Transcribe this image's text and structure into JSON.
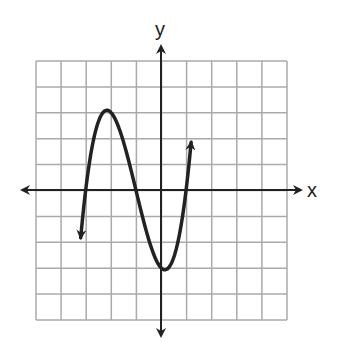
{
  "chart_data": {
    "type": "line",
    "title": "",
    "xlabel": "x",
    "ylabel": "y",
    "grid": true,
    "xlim": [
      -5,
      5
    ],
    "ylim": [
      -5,
      5
    ],
    "grid_step": 1,
    "tick_labels_shown": false,
    "function": "y = (x + 3)(x + 1)(x - 1)",
    "roots": [
      -3,
      -1,
      1
    ],
    "local_max": {
      "x": -2.15,
      "y": 3.08
    },
    "local_min": {
      "x": 0.15,
      "y": -3.08
    },
    "domain_drawn": [
      -3.2,
      1.2
    ],
    "end_behavior": {
      "left": "arrow down",
      "right": "arrow up"
    },
    "series": [
      {
        "name": "cubic",
        "x": [
          -3.2,
          -3.0,
          -2.8,
          -2.6,
          -2.4,
          -2.2,
          -2.0,
          -1.8,
          -1.6,
          -1.4,
          -1.2,
          -1.0,
          -0.8,
          -0.6,
          -0.4,
          -0.2,
          0.0,
          0.2,
          0.4,
          0.6,
          0.8,
          1.0,
          1.2
        ],
        "y": [
          -1.85,
          0.0,
          1.37,
          2.3,
          2.86,
          3.12,
          3.0,
          2.69,
          2.22,
          1.54,
          0.79,
          0.0,
          -0.79,
          -1.54,
          -2.18,
          -2.69,
          -3.0,
          -3.07,
          -2.86,
          -2.3,
          -1.37,
          0.0,
          1.85
        ]
      }
    ]
  },
  "labels": {
    "x_axis": "x",
    "y_axis": "y"
  },
  "colors": {
    "grid": "#aaaaaa",
    "axes": "#222222",
    "curve": "#222222"
  }
}
